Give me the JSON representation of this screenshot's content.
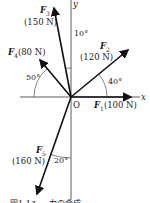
{
  "axes": {
    "x_label": "x",
    "y_label": "y",
    "origin_label": "O"
  },
  "forces": [
    {
      "name": "F",
      "sub": "1",
      "magnitude": "(100 N)",
      "angle_deg": 0
    },
    {
      "name": "F",
      "sub": "2",
      "magnitude": "(120 N)",
      "angle_deg": 40
    },
    {
      "name": "F",
      "sub": "3",
      "magnitude": "(150 N)",
      "angle_deg": 100
    },
    {
      "name": "F",
      "sub": "4",
      "magnitude": "(80 N)",
      "angle_deg": 130
    },
    {
      "name": "F",
      "sub": "5",
      "magnitude": "(160 N)",
      "angle_deg": 250
    }
  ],
  "angles": {
    "a40": "40°",
    "a10": "10°",
    "a50": "50°",
    "a20": "20°"
  },
  "caption": "図1-13 … 力の合成"
}
